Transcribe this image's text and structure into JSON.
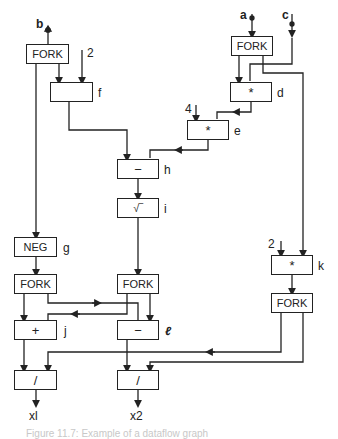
{
  "inputs": {
    "a": "a",
    "b": "b",
    "c": "c"
  },
  "constants": {
    "f_const": "2",
    "e_const": "4",
    "k_const": "2"
  },
  "nodes": {
    "fork_b": {
      "op": "FORK"
    },
    "f": {
      "op": "↑",
      "label": "f"
    },
    "fork_a": {
      "op": "FORK"
    },
    "d": {
      "op": "*",
      "label": "d"
    },
    "e": {
      "op": "*",
      "label": "e"
    },
    "h": {
      "op": "−",
      "label": "h"
    },
    "i": {
      "op": "√‾",
      "label": "i"
    },
    "g": {
      "op": "NEG",
      "label": "g"
    },
    "fork_g": {
      "op": "FORK"
    },
    "fork_i": {
      "op": "FORK"
    },
    "j": {
      "op": "+",
      "label": "j"
    },
    "l": {
      "op": "−",
      "label": "ℓ"
    },
    "k": {
      "op": "*",
      "label": "k"
    },
    "fork_k": {
      "op": "FORK"
    },
    "div1": {
      "op": "/"
    },
    "div2": {
      "op": "/"
    }
  },
  "outputs": {
    "x1": "xl",
    "x2": "x2"
  },
  "caption": "Figure 11.7: Example of a dataflow graph"
}
